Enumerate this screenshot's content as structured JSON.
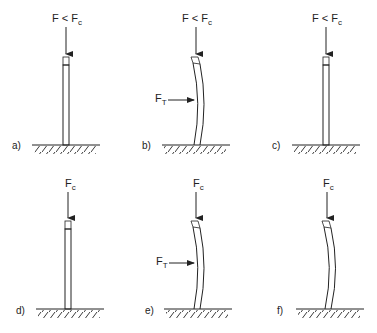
{
  "diagram": {
    "panels": [
      {
        "id": "a",
        "label": "a)",
        "axial_force": "F < F",
        "axial_sub": "c",
        "lateral_force": null,
        "state": "straight"
      },
      {
        "id": "b",
        "label": "b)",
        "axial_force": "F < F",
        "axial_sub": "c",
        "lateral_force": "F",
        "lateral_sub": "T",
        "state": "bent"
      },
      {
        "id": "c",
        "label": "c)",
        "axial_force": "F < F",
        "axial_sub": "c",
        "lateral_force": null,
        "state": "straight"
      },
      {
        "id": "d",
        "label": "d)",
        "axial_force": "F",
        "axial_sub": "c",
        "lateral_force": null,
        "state": "straight"
      },
      {
        "id": "e",
        "label": "e)",
        "axial_force": "F",
        "axial_sub": "c",
        "lateral_force": "F",
        "lateral_sub": "T",
        "state": "bent"
      },
      {
        "id": "f",
        "label": "f)",
        "axial_force": "F",
        "axial_sub": "c",
        "lateral_force": null,
        "state": "bent"
      }
    ],
    "colors": {
      "stroke": "#222222",
      "background": "#ffffff"
    }
  }
}
